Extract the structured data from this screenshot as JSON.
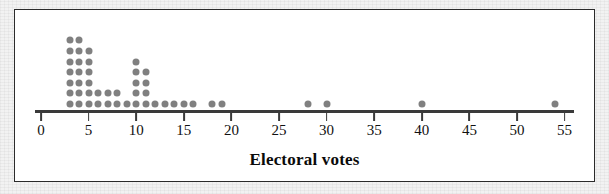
{
  "figure": {
    "background_color": "#ffffff",
    "border_color": "#2b2b2b",
    "page_color": "#f2f2f2"
  },
  "axis": {
    "title": "Electoral votes",
    "tick_labels": [
      "0",
      "5",
      "10",
      "15",
      "20",
      "25",
      "30",
      "35",
      "40",
      "45",
      "50",
      "55"
    ],
    "tick_values": [
      0,
      5,
      10,
      15,
      20,
      25,
      30,
      35,
      40,
      45,
      50,
      55
    ],
    "line_color": "#3a3a3a",
    "label_color": "#111111"
  },
  "marker": {
    "color": "#808080",
    "shape": "circle",
    "diameter_px": 7
  },
  "chart_data": {
    "type": "scatter",
    "plot_style": "dotplot",
    "title": "",
    "xlabel": "Electoral votes",
    "ylabel": "",
    "xlim": [
      0,
      56
    ],
    "grid": false,
    "legend": false,
    "x": [
      3,
      4,
      5,
      6,
      7,
      8,
      9,
      10,
      11,
      12,
      13,
      14,
      15,
      16,
      18,
      19,
      28,
      30,
      40,
      54
    ],
    "counts": [
      7,
      7,
      6,
      2,
      2,
      2,
      1,
      5,
      4,
      1,
      1,
      1,
      1,
      1,
      1,
      1,
      1,
      1,
      1,
      1
    ],
    "categories": [
      "3",
      "4",
      "5",
      "6",
      "7",
      "8",
      "9",
      "10",
      "11",
      "12",
      "13",
      "14",
      "15",
      "16",
      "18",
      "19",
      "28",
      "30",
      "40",
      "54"
    ],
    "values": [
      7,
      7,
      6,
      2,
      2,
      2,
      1,
      5,
      4,
      1,
      1,
      1,
      1,
      1,
      1,
      1,
      1,
      1,
      1,
      1
    ],
    "total_observations": 40
  }
}
